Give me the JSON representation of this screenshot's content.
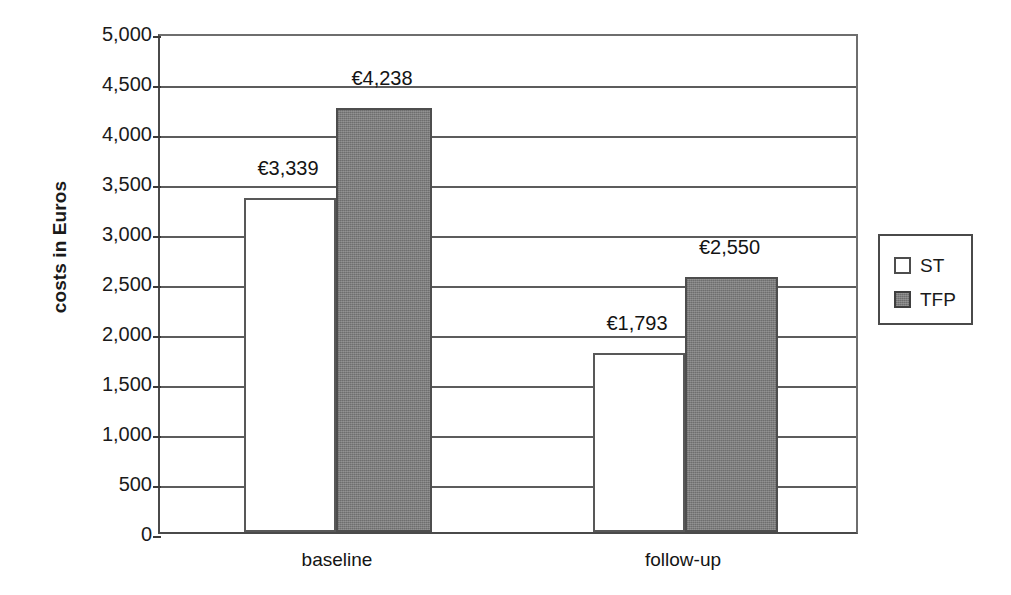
{
  "chart_data": {
    "type": "bar",
    "title": "",
    "subtitle": "",
    "xlabel": "",
    "ylabel": "costs in Euros",
    "categories": [
      "baseline",
      "follow-up"
    ],
    "series": [
      {
        "name": "ST",
        "values": [
          3339,
          1793
        ],
        "color": "#ffffff"
      },
      {
        "name": "TFP",
        "values": [
          4238,
          2550
        ],
        "color": "#7d7d7d"
      }
    ],
    "data_labels": [
      {
        "series": "ST",
        "category": "baseline",
        "text": "€3,339"
      },
      {
        "series": "TFP",
        "category": "baseline",
        "text": "€4,238"
      },
      {
        "series": "ST",
        "category": "follow-up",
        "text": "€1,793"
      },
      {
        "series": "TFP",
        "category": "follow-up",
        "text": "€2,550"
      }
    ],
    "ylim": [
      0,
      5000
    ],
    "ytick_step": 500,
    "ytick_labels": [
      "5,000",
      "4,500",
      "4,000",
      "3,500",
      "3,000",
      "2,500",
      "2,000",
      "1,500",
      "1,000",
      "500",
      "0"
    ],
    "ytick_values": [
      5000,
      4500,
      4000,
      3500,
      3000,
      2500,
      2000,
      1500,
      1000,
      500,
      0
    ],
    "grid": true,
    "grid_axis": "y",
    "legend_position": "right",
    "legend_entries": [
      "ST",
      "TFP"
    ],
    "currency_symbol": "€",
    "background_color": "#ffffff",
    "axis_color": "#4a4a4a"
  },
  "axis": {
    "y_title": "costs in Euros"
  },
  "legend": {
    "items": [
      {
        "label": "ST",
        "style": "open"
      },
      {
        "label": "TFP",
        "style": "filled"
      }
    ]
  },
  "x_categories": [
    {
      "label": "baseline"
    },
    {
      "label": "follow-up"
    }
  ],
  "bars": [
    {
      "name": "baseline-st",
      "label": "€3,339",
      "value": 3339,
      "series": "ST",
      "left": 242,
      "width": 92
    },
    {
      "name": "baseline-tfp",
      "label": "€4,238",
      "value": 4238,
      "series": "TFP",
      "left": 334,
      "width": 96
    },
    {
      "name": "followup-st",
      "label": "€1,793",
      "value": 1793,
      "series": "ST",
      "left": 591,
      "width": 92
    },
    {
      "name": "followup-tfp",
      "label": "€2,550",
      "value": 2550,
      "series": "TFP",
      "left": 683,
      "width": 93
    }
  ]
}
